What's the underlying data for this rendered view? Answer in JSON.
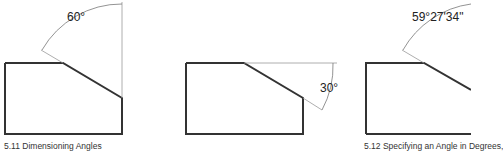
{
  "figures": [
    {
      "id": "5.11",
      "caption": "5.11  Dimensioning Angles",
      "angle_label": "60°"
    },
    {
      "id": "5.11b",
      "angle_label": "30°"
    },
    {
      "id": "5.12",
      "caption": "5.12  Specifying an Angle in Degrees,",
      "angle_label": "59°27'34\""
    }
  ]
}
